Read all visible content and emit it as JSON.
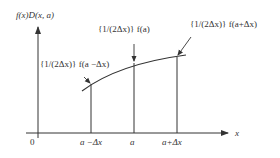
{
  "diagram": {
    "y_axis_label": "f(x)D(x, a)",
    "x_axis_label": "x",
    "origin_label": "0",
    "tick_labels": [
      "a −Δx",
      "a",
      "a+Δx"
    ],
    "annotations": [
      "{1/(2Δx)} f(a −Δx)",
      "{1/(2Δx)} f(a)",
      "{1/(2Δx)} f(a+Δx)"
    ],
    "colors": {
      "line": "#333333",
      "background": "#ffffff"
    }
  }
}
